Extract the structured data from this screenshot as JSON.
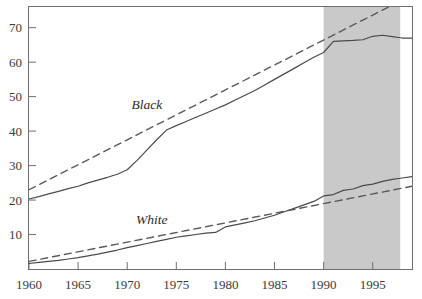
{
  "chart_data": {
    "type": "line",
    "title": "",
    "xlabel": "",
    "ylabel": "",
    "xlim": [
      1960,
      1999
    ],
    "ylim": [
      0,
      76
    ],
    "xticks": [
      1960,
      1965,
      1970,
      1975,
      1980,
      1985,
      1990,
      1995
    ],
    "xtick_labels": [
      "1960",
      "1965",
      "1970",
      "1975",
      "1980",
      "1985",
      "1990",
      "1995"
    ],
    "yticks": [
      10,
      20,
      30,
      40,
      50,
      60,
      70
    ],
    "ytick_labels": [
      "10",
      "20",
      "30",
      "40",
      "50",
      "60",
      "70"
    ],
    "grid": false,
    "legend_position": "inline-annotation",
    "annotations": [
      {
        "text": "Black",
        "x": 1972.0,
        "y": 46.5,
        "style": "italic"
      },
      {
        "text": "White",
        "x": 1972.5,
        "y": 13.0,
        "style": "italic"
      }
    ],
    "shaded_region": {
      "x_start": 1990,
      "x_end": 1997.8,
      "color": "#c9c9c9",
      "label": ""
    },
    "series": [
      {
        "name": "Black",
        "style": "solid",
        "color": "#4a4a4a",
        "x": [
          1960,
          1961,
          1962,
          1963,
          1964,
          1965,
          1966,
          1967,
          1968,
          1969,
          1970,
          1971,
          1972,
          1973,
          1974,
          1975,
          1976,
          1977,
          1978,
          1979,
          1980,
          1981,
          1982,
          1983,
          1984,
          1985,
          1986,
          1987,
          1988,
          1989,
          1990,
          1991,
          1992,
          1993,
          1994,
          1995,
          1996,
          1997,
          1998,
          1999
        ],
        "y": [
          20.3,
          21.0,
          21.8,
          22.5,
          23.3,
          24.0,
          25.0,
          25.8,
          26.6,
          27.5,
          28.8,
          31.5,
          34.5,
          37.5,
          40.3,
          41.6,
          42.8,
          44.0,
          45.2,
          46.4,
          47.6,
          49.0,
          50.4,
          51.8,
          53.4,
          55.0,
          56.6,
          58.2,
          59.8,
          61.4,
          62.8,
          66.0,
          66.2,
          66.3,
          66.5,
          67.5,
          67.8,
          67.4,
          67.0,
          67.0
        ]
      },
      {
        "name": "Black trend",
        "style": "dashed",
        "color": "#5a5a5a",
        "x": [
          1960,
          1998
        ],
        "y": [
          23.0,
          78.0
        ]
      },
      {
        "name": "White",
        "style": "solid",
        "color": "#4a4a4a",
        "x": [
          1960,
          1961,
          1962,
          1963,
          1964,
          1965,
          1966,
          1967,
          1968,
          1969,
          1970,
          1971,
          1972,
          1973,
          1974,
          1975,
          1976,
          1977,
          1978,
          1979,
          1980,
          1981,
          1982,
          1983,
          1984,
          1985,
          1986,
          1987,
          1988,
          1989,
          1990,
          1991,
          1992,
          1993,
          1994,
          1995,
          1996,
          1997,
          1998,
          1999
        ],
        "y": [
          1.6,
          1.9,
          2.2,
          2.5,
          2.9,
          3.3,
          3.8,
          4.3,
          4.9,
          5.5,
          6.2,
          6.8,
          7.4,
          8.0,
          8.6,
          9.2,
          9.6,
          10.0,
          10.4,
          10.6,
          12.2,
          12.8,
          13.4,
          14.0,
          14.8,
          15.6,
          16.6,
          17.6,
          18.6,
          19.6,
          21.2,
          21.6,
          22.8,
          23.2,
          24.2,
          24.6,
          25.4,
          26.0,
          26.4,
          26.8
        ]
      },
      {
        "name": "White trend",
        "style": "dashed",
        "color": "#5a5a5a",
        "x": [
          1960,
          1999
        ],
        "y": [
          2.2,
          24.0
        ]
      }
    ]
  },
  "axes": {
    "frame_color": "#6e6e6e",
    "tick_color": "#6e6e6e"
  }
}
